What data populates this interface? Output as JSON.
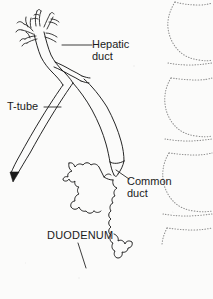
{
  "figure": {
    "background_color": "#fbfbfa",
    "ink_color": "#1a1a1a",
    "stipple_color": "#8d8d8d",
    "width": 213,
    "height": 299
  },
  "labels": {
    "hepatic_duct": "Hepatic\nduct",
    "t_tube": "T-tube",
    "common_duct": "Common\nduct",
    "duodenum": "DUODENUM"
  },
  "structures": [
    {
      "name": "intrahepatic-biliary-radicles",
      "description": "branching tree of fine hepatic duct radicles at top left"
    },
    {
      "name": "hepatic-duct",
      "description": "confluence duct descending from the hepatic radicles"
    },
    {
      "name": "t-tube",
      "description": "double-line catheter entering the duct and exiting inferolaterally to an arrow tip"
    },
    {
      "name": "t-tube-arrow",
      "description": "solid arrowhead at the distal end of the T-tube"
    },
    {
      "name": "common-duct",
      "description": "common bile duct descending and tapering to a point"
    },
    {
      "name": "duodenum",
      "description": "scalloped duodenal loop outline with mucosal folds"
    },
    {
      "name": "vertebral-bodies",
      "description": "three stippled vertebral body outlines along the right margin"
    }
  ],
  "leaders": [
    {
      "name": "hepatic-duct-leader",
      "from_label": "Hepatic duct",
      "to_structure": "hepatic-duct"
    },
    {
      "name": "t-tube-leader",
      "from_label": "T-tube",
      "to_structure": "t-tube"
    },
    {
      "name": "common-duct-leader",
      "from_label": "Common duct",
      "to_structure": "common-duct"
    },
    {
      "name": "duodenum-leader",
      "from_label": "DUODENUM",
      "to_structure": "duodenum"
    }
  ]
}
